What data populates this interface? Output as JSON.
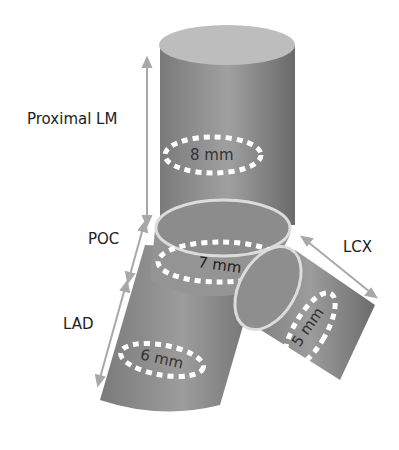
{
  "labels": {
    "proximal_lm": "Proximal LM",
    "poc": "POC",
    "lad": "LAD",
    "lcx": "LCX"
  },
  "diameters": {
    "proximal_lm": "8 mm",
    "poc": "7 mm",
    "lad": "6 mm",
    "lcx": "5 mm"
  },
  "colors": {
    "vessel": "#8a8a8a",
    "vessel_dark": "#6e6e6e",
    "vessel_light": "#b5b5b5",
    "arrow": "#a8a8a8",
    "dash": "#ffffff"
  }
}
